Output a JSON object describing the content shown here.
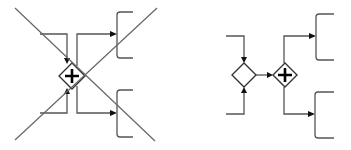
{
  "diagram": {
    "left": {
      "label": "incorrect-usage",
      "gateway": {
        "type": "parallel",
        "symbol": "+",
        "cx": 72,
        "cy": 76,
        "r": 13
      },
      "crossed_out": true,
      "inputs": 2,
      "outputs": 2
    },
    "right": {
      "label": "correct-usage",
      "merge_gateway": {
        "type": "exclusive-empty",
        "cx": 244,
        "cy": 75,
        "r": 12
      },
      "split_gateway": {
        "type": "parallel",
        "symbol": "+",
        "cx": 285,
        "cy": 75,
        "r": 12
      },
      "inputs": 2,
      "outputs": 2
    },
    "colors": {
      "stroke": "#555555",
      "cross": "#666666",
      "arrow": "#111111",
      "background": "#ffffff"
    }
  }
}
